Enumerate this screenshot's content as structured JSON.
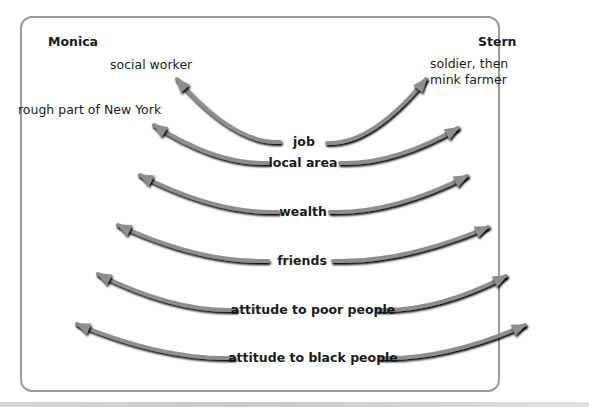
{
  "title_partial_top": "",
  "people": {
    "left": {
      "name": "Monica",
      "job": "social worker",
      "local_area": "rough part of New York"
    },
    "right": {
      "name": "Stern",
      "job_line1": "soldier, then",
      "job_line2": "mink farmer"
    }
  },
  "rows": [
    {
      "label": "job"
    },
    {
      "label": "local area"
    },
    {
      "label": "wealth"
    },
    {
      "label": "friends"
    },
    {
      "label": "attitude to poor people"
    },
    {
      "label": "attitude to black people"
    }
  ],
  "colors": {
    "arrow_fill": "#8e8e8e",
    "arrow_shadow": "#222222",
    "frame": "#9a9a9a"
  }
}
